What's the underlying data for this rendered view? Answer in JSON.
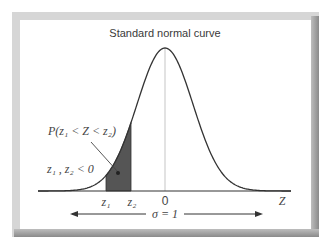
{
  "title": "Standard normal curve",
  "labels": {
    "probability": "P(z₁ < Z < z₂)",
    "condition": "z₁ , z₂ < 0",
    "z1": "z₁",
    "z2": "z₂",
    "zero": "0",
    "axis": "Z",
    "sigma": "σ = 1"
  },
  "colors": {
    "curve": "#333333",
    "shaded_area": "#555555",
    "center_line": "#cfcfcf",
    "axis": "#333333",
    "frame": "#d6d6d6"
  },
  "curve_params": {
    "mean_x": 165,
    "baseline_y": 191,
    "peak_height": 143,
    "sigma_px": 28,
    "x_start": 38,
    "x_end": 291,
    "z1_x": 106,
    "z2_x": 131
  }
}
